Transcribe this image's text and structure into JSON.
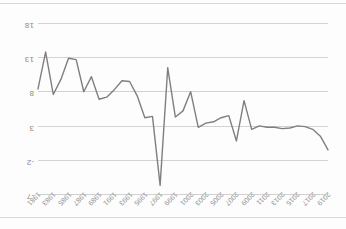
{
  "page": {
    "orientation_note": "upside-down",
    "background_color": "#fdfdfd",
    "border_color": "#d9d9d9"
  },
  "chart_data": {
    "type": "line",
    "title": "",
    "xlabel": "",
    "ylabel": "",
    "grid": true,
    "legend": "none",
    "line_color": "#7f7f7f",
    "grid_color": "#d2d2d2",
    "tick_color": "#8a8a8a",
    "ylim": [
      -7,
      18
    ],
    "y_inverted": true,
    "yticks": [
      "-7",
      "-2",
      "3",
      "8",
      "13",
      "18"
    ],
    "ytick_values": [
      -7,
      -2,
      3,
      8,
      13,
      18
    ],
    "x_order": "descending",
    "categories": [
      "2019",
      "2018",
      "2017",
      "2016",
      "2015",
      "2014",
      "2013",
      "2012",
      "2011",
      "2010",
      "2009",
      "2008",
      "2007",
      "2006",
      "2005",
      "2004",
      "2003",
      "2002",
      "2001",
      "2000",
      "1999",
      "1998",
      "1997",
      "1996",
      "1995",
      "1994",
      "1993",
      "1992",
      "1991",
      "1990",
      "1989",
      "1988",
      "1987",
      "1986",
      "1985",
      "1984",
      "1983",
      "1982",
      "1981"
    ],
    "xticks_shown": [
      "2019",
      "2017",
      "2015",
      "2013",
      "2011",
      "2009",
      "2007",
      "2005",
      "2003",
      "2001",
      "1999",
      "1997",
      "1995",
      "1993",
      "1991",
      "1989",
      "1987",
      "1985",
      "1983",
      "1981"
    ],
    "values": [
      -0.4,
      1.6,
      2.6,
      3.0,
      3.1,
      2.8,
      2.7,
      2.9,
      2.9,
      3.1,
      2.6,
      6.8,
      0.9,
      4.6,
      4.3,
      3.7,
      3.5,
      2.9,
      8.1,
      5.3,
      4.4,
      11.6,
      -5.6,
      4.5,
      4.3,
      7.5,
      9.6,
      9.7,
      8.4,
      7.3,
      7.0,
      10.3,
      8.1,
      12.8,
      13.0,
      9.9,
      7.7,
      13.9,
      8.5
    ]
  }
}
